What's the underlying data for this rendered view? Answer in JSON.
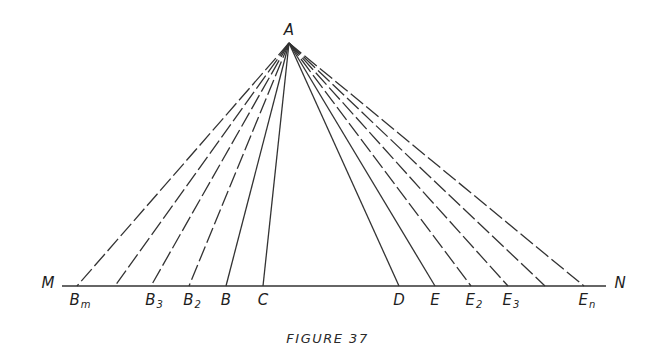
{
  "figure": {
    "caption": "FIGURE 37",
    "apex": {
      "label": "A",
      "x": 289,
      "y": 43
    },
    "baseline": {
      "left_label": "M",
      "right_label": "N",
      "y": 286,
      "x_start": 62,
      "x_end": 606
    },
    "points": [
      {
        "id": "Bm",
        "label": "B",
        "sub": "m",
        "x": 77,
        "style": "dashed"
      },
      {
        "id": "B4",
        "label": "",
        "sub": "",
        "x": 115,
        "style": "dashed"
      },
      {
        "id": "B3",
        "label": "B",
        "sub": "3",
        "x": 151,
        "style": "dashed"
      },
      {
        "id": "B2",
        "label": "B",
        "sub": "2",
        "x": 189,
        "style": "dashed"
      },
      {
        "id": "B",
        "label": "B",
        "sub": "",
        "x": 226,
        "style": "solid"
      },
      {
        "id": "C",
        "label": "C",
        "sub": "",
        "x": 263,
        "style": "solid"
      },
      {
        "id": "D",
        "label": "D",
        "sub": "",
        "x": 399,
        "style": "solid"
      },
      {
        "id": "E",
        "label": "E",
        "sub": "",
        "x": 435,
        "style": "solid"
      },
      {
        "id": "E2",
        "label": "E",
        "sub": "2",
        "x": 471,
        "style": "dashed"
      },
      {
        "id": "E3",
        "label": "E",
        "sub": "3",
        "x": 508,
        "style": "dashed"
      },
      {
        "id": "E4",
        "label": "",
        "sub": "",
        "x": 545,
        "style": "dashed"
      },
      {
        "id": "En",
        "label": "E",
        "sub": "n",
        "x": 584,
        "style": "dashed"
      }
    ],
    "colors": {
      "line": "#333333",
      "text": "#1e1e1e",
      "background": "#ffffff"
    }
  }
}
